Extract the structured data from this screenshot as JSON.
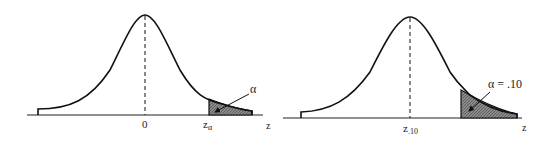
{
  "figure": {
    "left_panel": {
      "title": "Upper-tail rejection region at level alpha",
      "mean_label": "0",
      "critical_label": "z",
      "critical_subscript": "α",
      "axis_label": "z",
      "area_label": "α",
      "shaded_tail": "right"
    },
    "right_panel": {
      "title": "Upper-tail rejection region with alpha = .10",
      "center_label": "z",
      "center_subscript": ".10",
      "axis_label": "z",
      "area_label": "α = .10",
      "shaded_tail": "right"
    },
    "colors": {
      "curve": "#111111",
      "axis": "#222222",
      "shade": "#7a7a7a",
      "background": "#ffffff"
    }
  }
}
